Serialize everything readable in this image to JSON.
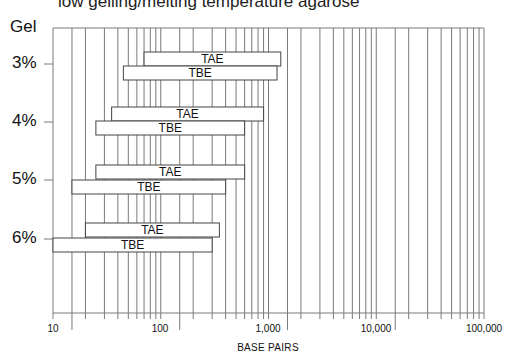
{
  "caption": "low gelling/melting temperature agarose",
  "y_title": "Gel",
  "chart_data": {
    "type": "bar",
    "orientation": "horizontal-range",
    "title": "low gelling/melting temperature agarose",
    "xlabel": "BASE PAIRS",
    "ylabel": "Gel",
    "xscale": "log",
    "xlim": [
      10,
      100000
    ],
    "x_ticks": [
      10,
      100,
      1000,
      10000,
      100000
    ],
    "x_tick_labels": [
      "10",
      "100",
      "1,000",
      "10,000",
      "100,000"
    ],
    "grid": true,
    "categories": [
      "3%",
      "4%",
      "5%",
      "6%"
    ],
    "series": [
      {
        "name": "TAE",
        "ranges": [
          [
            70,
            1300
          ],
          [
            35,
            900
          ],
          [
            25,
            600
          ],
          [
            20,
            350
          ]
        ]
      },
      {
        "name": "TBE",
        "ranges": [
          [
            45,
            1200
          ],
          [
            25,
            600
          ],
          [
            15,
            400
          ],
          [
            10,
            300
          ]
        ]
      }
    ]
  },
  "labels": {
    "tae": "TAE",
    "tbe": "TBE",
    "gel_3": "3%",
    "gel_4": "4%",
    "gel_5": "5%",
    "gel_6": "6%",
    "x_10": "10",
    "x_100": "100",
    "x_1000": "1,000",
    "x_10000": "10,000",
    "x_100000": "100,000",
    "xaxis": "BASE PAIRS"
  },
  "colors": {
    "grid": "#7a7a7a",
    "bar_border": "#444444",
    "bar_fill": "#ffffff",
    "text": "#111111"
  }
}
